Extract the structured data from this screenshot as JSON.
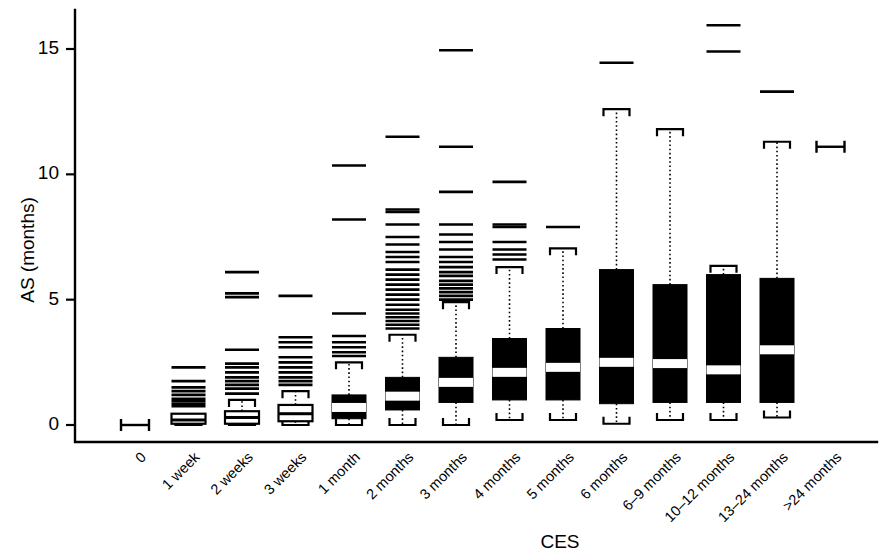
{
  "chart_data": {
    "type": "box",
    "title": "",
    "xlabel": "CES",
    "ylabel": "AS (months)",
    "ylim": [
      -0.6,
      16.6
    ],
    "yticks": [
      0,
      5,
      10,
      15
    ],
    "ytick_labels": [
      "0",
      "5",
      "10",
      "15"
    ],
    "grid": false,
    "legend": "none",
    "categories": [
      "0",
      "1 week",
      "2 weeks",
      "3 weeks",
      "1 month",
      "2 months",
      "3 months",
      "4 months",
      "5 months",
      "6 months",
      "6–9 months",
      "10–12 months",
      "13–24 months",
      ">24 months"
    ],
    "boxes": [
      {
        "category": "0",
        "q1": 0.0,
        "median": 0.0,
        "q3": 0.0,
        "whisker_low": 0.0,
        "whisker_high": 0.0,
        "style": "point",
        "outliers": []
      },
      {
        "category": "1 week",
        "q1": 0.05,
        "median": 0.2,
        "q3": 0.45,
        "whisker_low": 0.0,
        "whisker_high": 0.45,
        "style": "open",
        "outliers": [
          0.75,
          0.85,
          0.95,
          1.05,
          1.2,
          1.35,
          1.5,
          1.75,
          2.3
        ]
      },
      {
        "category": "2 weeks",
        "q1": 0.05,
        "median": 0.3,
        "q3": 0.55,
        "whisker_low": 0.0,
        "whisker_high": 1.0,
        "style": "open",
        "outliers": [
          1.25,
          1.45,
          1.6,
          1.75,
          1.9,
          2.1,
          2.3,
          2.45,
          3.0,
          5.1,
          5.25,
          6.1
        ]
      },
      {
        "category": "3 weeks",
        "q1": 0.15,
        "median": 0.45,
        "q3": 0.8,
        "whisker_low": 0.0,
        "whisker_high": 1.35,
        "style": "open",
        "outliers": [
          1.6,
          1.75,
          1.9,
          2.1,
          2.3,
          2.5,
          2.7,
          3.1,
          3.3,
          3.5,
          5.15
        ]
      },
      {
        "category": "1 month",
        "q1": 0.25,
        "median": 0.7,
        "q3": 1.2,
        "whisker_low": 0.0,
        "whisker_high": 2.5,
        "style": "fill",
        "outliers": [
          2.75,
          2.9,
          3.1,
          3.3,
          3.55,
          4.45,
          8.2,
          10.35
        ]
      },
      {
        "category": "2 months",
        "q1": 0.6,
        "median": 1.15,
        "q3": 1.9,
        "whisker_low": 0.0,
        "whisker_high": 3.6,
        "style": "fill",
        "outliers": [
          3.85,
          4.0,
          4.15,
          4.3,
          4.45,
          4.6,
          4.8,
          5.0,
          5.2,
          5.4,
          5.6,
          5.8,
          6.0,
          6.2,
          6.5,
          6.7,
          6.9,
          7.2,
          7.5,
          8.0,
          8.5,
          8.6,
          11.5
        ]
      },
      {
        "category": "3 months",
        "q1": 0.9,
        "median": 1.7,
        "q3": 2.7,
        "whisker_low": 0.0,
        "whisker_high": 4.9,
        "style": "fill",
        "outliers": [
          5.0,
          5.15,
          5.3,
          5.45,
          5.6,
          5.75,
          5.95,
          6.1,
          6.3,
          6.5,
          6.7,
          7.0,
          7.3,
          7.6,
          8.0,
          9.3,
          11.1,
          14.95
        ]
      },
      {
        "category": "4 months",
        "q1": 1.0,
        "median": 2.1,
        "q3": 3.45,
        "whisker_low": 0.2,
        "whisker_high": 6.3,
        "style": "fill",
        "outliers": [
          6.6,
          6.8,
          7.0,
          7.3,
          7.9,
          8.0,
          9.7
        ]
      },
      {
        "category": "5 months",
        "q1": 1.0,
        "median": 2.3,
        "q3": 3.85,
        "whisker_low": 0.2,
        "whisker_high": 7.05,
        "style": "fill",
        "outliers": [
          7.9
        ]
      },
      {
        "category": "6 months",
        "q1": 0.85,
        "median": 2.5,
        "q3": 6.2,
        "whisker_low": 0.05,
        "whisker_high": 12.6,
        "style": "fill",
        "outliers": [
          14.45
        ]
      },
      {
        "category": "6–9 months",
        "q1": 0.9,
        "median": 2.45,
        "q3": 5.6,
        "whisker_low": 0.2,
        "whisker_high": 11.8,
        "style": "fill",
        "outliers": []
      },
      {
        "category": "10–12 months",
        "q1": 0.9,
        "median": 2.2,
        "q3": 6.0,
        "whisker_low": 0.2,
        "whisker_high": 6.35,
        "style": "fill",
        "outliers": [
          14.9,
          15.95
        ]
      },
      {
        "category": "13–24 months",
        "q1": 0.9,
        "median": 3.0,
        "q3": 5.85,
        "whisker_low": 0.3,
        "whisker_high": 11.3,
        "style": "fill",
        "outliers": [
          13.3
        ]
      },
      {
        "category": ">24 months",
        "q1": 11.1,
        "median": 11.1,
        "q3": 11.1,
        "whisker_low": 11.1,
        "whisker_high": 11.1,
        "style": "point",
        "outliers": []
      }
    ]
  },
  "axes": {
    "y_title": "AS (months)",
    "x_title": "CES"
  }
}
